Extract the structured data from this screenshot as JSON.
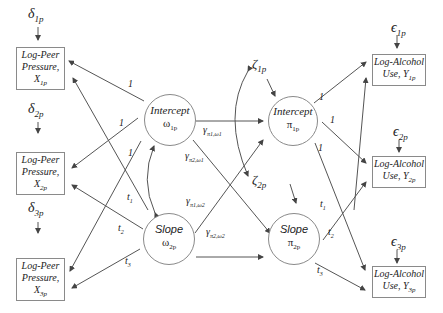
{
  "diagram": {
    "type": "latent-growth-curve-path-diagram",
    "indicators_left": [
      {
        "id": "x1",
        "line1": "Log-Peer",
        "line2": "Pressure,",
        "var": "X",
        "sub": "1p",
        "error": "δ",
        "error_sub": "1p"
      },
      {
        "id": "x2",
        "line1": "Log-Peer",
        "line2": "Pressure,",
        "var": "X",
        "sub": "2p",
        "error": "δ",
        "error_sub": "2p"
      },
      {
        "id": "x3",
        "line1": "Log-Peer",
        "line2": "Pressure,",
        "var": "X",
        "sub": "3p",
        "error": "δ",
        "error_sub": "3p"
      }
    ],
    "indicators_right": [
      {
        "id": "y1",
        "line1": "Log-Alcohol",
        "line2": "Use, ",
        "var": "Y",
        "sub": "1p",
        "error": "ϵ",
        "error_sub": "1p"
      },
      {
        "id": "y2",
        "line1": "Log-Alcohol",
        "line2": "Use, ",
        "var": "Y",
        "sub": "2p",
        "error": "ϵ",
        "error_sub": "2p"
      },
      {
        "id": "y3",
        "line1": "Log-Alcohol",
        "line2": "Use, ",
        "var": "Y",
        "sub": "3p",
        "error": "ϵ",
        "error_sub": "3p"
      }
    ],
    "latents": {
      "omega1": {
        "title": "Intercept",
        "symbol": "ω",
        "sub": "1p"
      },
      "omega2": {
        "title": "Slope",
        "symbol": "ω",
        "sub": "2p"
      },
      "pi1": {
        "title": "Intercept",
        "symbol": "π",
        "sub": "1p"
      },
      "pi2": {
        "title": "Slope",
        "symbol": "π",
        "sub": "2p"
      }
    },
    "disturbances": {
      "zeta1": {
        "symbol": "ζ",
        "sub": "1p"
      },
      "zeta2": {
        "symbol": "ζ",
        "sub": "2p"
      }
    },
    "loadings": {
      "intercept": [
        "1",
        "1",
        "1"
      ],
      "slope": [
        {
          "t": "t",
          "sub": "1"
        },
        {
          "t": "t",
          "sub": "2"
        },
        {
          "t": "t",
          "sub": "3"
        }
      ]
    },
    "structural_paths": {
      "g11": {
        "symbol": "γ",
        "sub": "π1,ω1"
      },
      "g21": {
        "symbol": "γ",
        "sub": "π2,ω1"
      },
      "g12": {
        "symbol": "γ",
        "sub": "π1,ω2"
      },
      "g22": {
        "symbol": "γ",
        "sub": "π2,ω2"
      }
    }
  }
}
